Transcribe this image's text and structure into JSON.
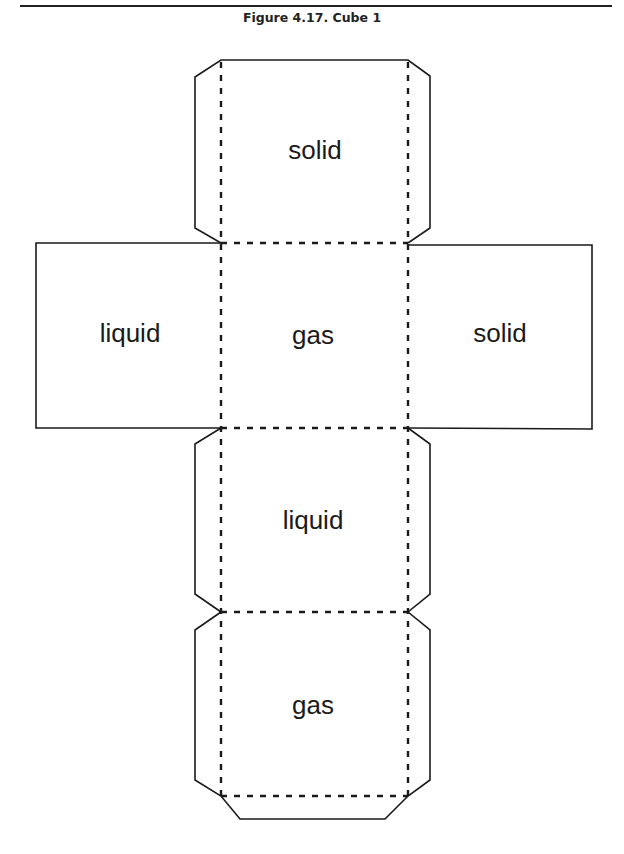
{
  "figure": {
    "title": "Figure 4.17. Cube 1",
    "colors": {
      "line": "#1a1a1a",
      "background": "#ffffff"
    }
  },
  "faces": {
    "top": "solid",
    "left": "liquid",
    "center": "gas",
    "right": "solid",
    "lower": "liquid",
    "bottom": "gas"
  }
}
